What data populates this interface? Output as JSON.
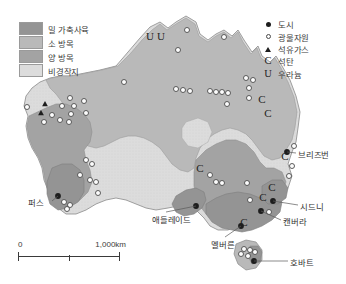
{
  "map": {
    "region_name": "Australia",
    "background_color": "#ffffff",
    "colors": {
      "wheat_livestock": "#949494",
      "cattle_grazing": "#b9b9b9",
      "sheep_grazing": "#a3a3a3",
      "non_arable": "#dcdcdc",
      "outline": "#8a8a8a",
      "city_marker": "#1d1d1d",
      "mineral_marker_fill": "#fdfdfd",
      "mineral_marker_stroke": "#4b4b4b",
      "text": "#333333"
    }
  },
  "legend_landuse": {
    "items": [
      {
        "label": "밀 가축사육",
        "color": "#949494",
        "key": "wheat-livestock"
      },
      {
        "label": "소 방목",
        "color": "#b9b9b9",
        "key": "cattle-grazing"
      },
      {
        "label": "양 방목",
        "color": "#a3a3a3",
        "key": "sheep-grazing"
      },
      {
        "label": "비경작지",
        "color": "#dcdcdc",
        "key": "non-arable"
      }
    ]
  },
  "legend_symbols": {
    "items": [
      {
        "label": "도시",
        "marker": "filled-circle",
        "icon_name": "city-dot-icon"
      },
      {
        "label": "광물자원",
        "marker": "open-circle",
        "icon_name": "mineral-circle-icon"
      },
      {
        "label": "석유가스",
        "marker": "triangle",
        "icon_name": "oil-gas-triangle-icon"
      },
      {
        "label": "석탄",
        "marker": "C",
        "icon_name": "coal-letter-icon"
      },
      {
        "label": "우라늄",
        "marker": "U",
        "icon_name": "uranium-letter-icon"
      }
    ]
  },
  "city_labels": [
    {
      "name": "퍼스",
      "x": 28,
      "y": 196,
      "leader": "right"
    },
    {
      "name": "애들레이드",
      "x": 152,
      "y": 213,
      "leader": "upright"
    },
    {
      "name": "멜버른",
      "x": 211,
      "y": 238,
      "leader": "up"
    },
    {
      "name": "브리즈번",
      "x": 298,
      "y": 148,
      "leader": "left"
    },
    {
      "name": "시드니",
      "x": 300,
      "y": 200,
      "leader": "left"
    },
    {
      "name": "캔버라",
      "x": 283,
      "y": 215,
      "leader": "left"
    },
    {
      "name": "호바트",
      "x": 290,
      "y": 256,
      "leader": "left"
    }
  ],
  "coal_markers": [
    {
      "x": 262,
      "y": 103
    },
    {
      "x": 268,
      "y": 117
    },
    {
      "x": 285,
      "y": 160
    },
    {
      "x": 200,
      "y": 172
    },
    {
      "x": 272,
      "y": 191
    },
    {
      "x": 263,
      "y": 201
    },
    {
      "x": 244,
      "y": 226
    }
  ],
  "uranium_markers": [
    {
      "x": 150,
      "y": 40
    },
    {
      "x": 161,
      "y": 40
    }
  ],
  "oilgas_markers": [
    {
      "x": 45,
      "y": 104
    },
    {
      "x": 41,
      "y": 113
    }
  ],
  "city_markers": [
    {
      "x": 58,
      "y": 196
    },
    {
      "x": 196,
      "y": 206
    },
    {
      "x": 241,
      "y": 226
    },
    {
      "x": 287,
      "y": 152
    },
    {
      "x": 273,
      "y": 201
    },
    {
      "x": 261,
      "y": 211
    },
    {
      "x": 254,
      "y": 261
    }
  ],
  "mineral_markers": [
    {
      "x": 187,
      "y": 30
    },
    {
      "x": 178,
      "y": 50
    },
    {
      "x": 224,
      "y": 37
    },
    {
      "x": 124,
      "y": 82
    },
    {
      "x": 27,
      "y": 107
    },
    {
      "x": 70,
      "y": 98
    },
    {
      "x": 62,
      "y": 106
    },
    {
      "x": 74,
      "y": 106
    },
    {
      "x": 84,
      "y": 101
    },
    {
      "x": 52,
      "y": 115
    },
    {
      "x": 60,
      "y": 120
    },
    {
      "x": 69,
      "y": 122
    },
    {
      "x": 44,
      "y": 122
    },
    {
      "x": 71,
      "y": 114
    },
    {
      "x": 86,
      "y": 113
    },
    {
      "x": 176,
      "y": 89
    },
    {
      "x": 183,
      "y": 90
    },
    {
      "x": 190,
      "y": 91
    },
    {
      "x": 210,
      "y": 91
    },
    {
      "x": 216,
      "y": 92
    },
    {
      "x": 222,
      "y": 92
    },
    {
      "x": 228,
      "y": 93
    },
    {
      "x": 246,
      "y": 78
    },
    {
      "x": 249,
      "y": 88
    },
    {
      "x": 253,
      "y": 80
    },
    {
      "x": 227,
      "y": 104
    },
    {
      "x": 249,
      "y": 98
    },
    {
      "x": 86,
      "y": 160
    },
    {
      "x": 92,
      "y": 164
    },
    {
      "x": 90,
      "y": 180
    },
    {
      "x": 96,
      "y": 182
    },
    {
      "x": 80,
      "y": 175
    },
    {
      "x": 98,
      "y": 193
    },
    {
      "x": 64,
      "y": 202
    },
    {
      "x": 70,
      "y": 205
    },
    {
      "x": 67,
      "y": 209
    },
    {
      "x": 210,
      "y": 175
    },
    {
      "x": 216,
      "y": 182
    },
    {
      "x": 222,
      "y": 183
    },
    {
      "x": 247,
      "y": 183
    },
    {
      "x": 250,
      "y": 200
    },
    {
      "x": 294,
      "y": 146
    },
    {
      "x": 292,
      "y": 166
    },
    {
      "x": 289,
      "y": 176
    },
    {
      "x": 269,
      "y": 212
    },
    {
      "x": 244,
      "y": 249
    },
    {
      "x": 250,
      "y": 250
    },
    {
      "x": 241,
      "y": 254
    },
    {
      "x": 248,
      "y": 256
    },
    {
      "x": 255,
      "y": 252
    }
  ],
  "scale_bar": {
    "zero_label": "0",
    "max_label": "1,000km"
  }
}
